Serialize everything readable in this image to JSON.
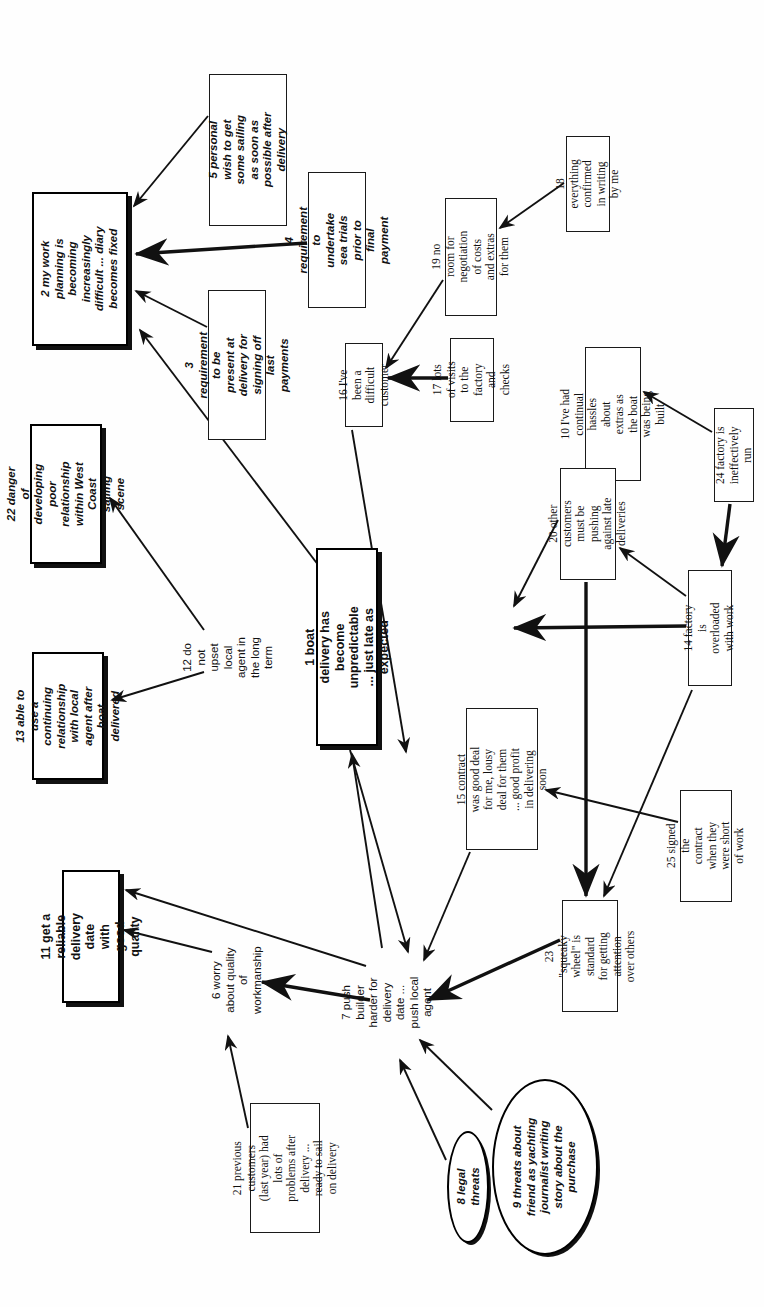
{
  "diagram": {
    "orientation": "text rotated 90 degrees (reads bottom-to-top)",
    "background_color": "#ffffff",
    "line_color": "#111111",
    "nodes": [
      {
        "id": "n1",
        "number": "1",
        "label": "1 boat delivery has become unpredictable ... just late as expected",
        "shape": "box-shadow",
        "style": "bold",
        "x": 316,
        "y": 548,
        "w": 62,
        "h": 198
      },
      {
        "id": "n2",
        "number": "2",
        "label": "2 my work planning is becoming increasingly difficult ... diary becomes fixed",
        "shape": "box-shadow",
        "style": "bold-italic",
        "x": 32,
        "y": 192,
        "w": 96,
        "h": 154
      },
      {
        "id": "n3",
        "number": "3",
        "label": "3 requirement to be present at delivery for signing off last payments",
        "shape": "box",
        "style": "italic",
        "x": 208,
        "y": 290,
        "w": 58,
        "h": 150
      },
      {
        "id": "n4",
        "number": "4",
        "label": "4 requirement to undertake sea trials prior to final payment",
        "shape": "box",
        "style": "italic",
        "x": 308,
        "y": 172,
        "w": 58,
        "h": 136
      },
      {
        "id": "n5",
        "number": "5",
        "label": "5 personal wish to get some sailing as soon as possible after delivery",
        "shape": "box",
        "style": "italic",
        "x": 209,
        "y": 74,
        "w": 78,
        "h": 152
      },
      {
        "id": "n6",
        "number": "6",
        "label": "6 worry about quality of workmanship",
        "shape": "plain",
        "style": "plain-sans",
        "x": 215,
        "y": 930,
        "w": 44,
        "h": 100
      },
      {
        "id": "n7",
        "number": "7",
        "label": "7 push builder harder for delivery date ... push local agent",
        "shape": "plain",
        "style": "plain-sans",
        "x": 358,
        "y": 952,
        "w": 58,
        "h": 100
      },
      {
        "id": "n8",
        "number": "8",
        "label": "8 legal threats",
        "shape": "ellipse",
        "style": "bold-italic",
        "x": 447,
        "y": 1131,
        "w": 42,
        "h": 112
      },
      {
        "id": "n9",
        "number": "9",
        "label": "9 threats about friend as yachting journalist writing story about the purchase",
        "shape": "ellipse",
        "style": "bold-italic",
        "x": 492,
        "y": 1079,
        "w": 106,
        "h": 176
      },
      {
        "id": "n10",
        "number": "10",
        "label": "10 I've had continual hassles about extras as the boat was being built",
        "shape": "box",
        "style": "serif",
        "x": 585,
        "y": 347,
        "w": 56,
        "h": 134
      },
      {
        "id": "n11",
        "number": "11",
        "label": "11 get a reliable delivery date with good quality",
        "shape": "box-shadow",
        "style": "bold",
        "x": 62,
        "y": 870,
        "w": 58,
        "h": 133
      },
      {
        "id": "n12",
        "number": "12",
        "label": "12 do not upset local agent in the long term",
        "shape": "plain",
        "style": "plain-sans",
        "x": 206,
        "y": 608,
        "w": 44,
        "h": 98
      },
      {
        "id": "n13",
        "number": "13",
        "label": "13 able to use a continuing relationship with local agent after boat delivered",
        "shape": "box-shadow",
        "style": "bold-italic",
        "x": 32,
        "y": 652,
        "w": 72,
        "h": 128
      },
      {
        "id": "n14",
        "number": "14",
        "label": "14 factory is overloaded with work",
        "shape": "box",
        "style": "serif",
        "x": 688,
        "y": 570,
        "w": 44,
        "h": 116
      },
      {
        "id": "n15",
        "number": "15",
        "label": "15 contract was good deal for me, lousy deal for them ... good profit in delivering soon",
        "shape": "box",
        "style": "serif",
        "x": 466,
        "y": 708,
        "w": 72,
        "h": 142
      },
      {
        "id": "n16",
        "number": "16",
        "label": "16 I've been a difficult customer",
        "shape": "box",
        "style": "serif",
        "x": 345,
        "y": 343,
        "w": 38,
        "h": 84
      },
      {
        "id": "n17",
        "number": "17",
        "label": "17 lots of visits to the factory and checks",
        "shape": "box",
        "style": "serif",
        "x": 450,
        "y": 338,
        "w": 44,
        "h": 84
      },
      {
        "id": "n18",
        "number": "18",
        "label": "18 everything confirmed in writing by me",
        "shape": "box",
        "style": "serif",
        "x": 566,
        "y": 136,
        "w": 44,
        "h": 96
      },
      {
        "id": "n19",
        "number": "19",
        "label": "19 no room for negotiation of costs and extras for them",
        "shape": "box",
        "style": "serif",
        "x": 445,
        "y": 198,
        "w": 52,
        "h": 118
      },
      {
        "id": "n20",
        "number": "20",
        "label": "20 other customers must be pushing against late deliveries",
        "shape": "box",
        "style": "serif",
        "x": 560,
        "y": 468,
        "w": 56,
        "h": 112
      },
      {
        "id": "n21",
        "number": "21",
        "label": "21 previous customers (last year) had lots of problems after delivery ... ready to sail on delivery",
        "shape": "box",
        "style": "serif",
        "x": 250,
        "y": 1103,
        "w": 70,
        "h": 130
      },
      {
        "id": "n22",
        "number": "22",
        "label": "22 danger of developing poor relationship within West Coast sailing scene",
        "shape": "box-shadow",
        "style": "bold-italic",
        "x": 30,
        "y": 424,
        "w": 72,
        "h": 140
      },
      {
        "id": "n23",
        "number": "23",
        "label": "23 \"squeaky wheel\" is standard for getting attention over others",
        "shape": "box",
        "style": "serif",
        "x": 562,
        "y": 900,
        "w": 56,
        "h": 112
      },
      {
        "id": "n24",
        "number": "24",
        "label": "24 factory is ineffectively run",
        "shape": "box",
        "style": "serif",
        "x": 714,
        "y": 408,
        "w": 40,
        "h": 94
      },
      {
        "id": "n25",
        "number": "25",
        "label": "25 signed the contract when they were short of work",
        "shape": "box",
        "style": "serif",
        "x": 680,
        "y": 790,
        "w": 52,
        "h": 112
      }
    ],
    "links": [
      {
        "from": "n5",
        "to": "n2",
        "path": "M 208 116 L 134 206"
      },
      {
        "from": "n4",
        "to": "n2",
        "path": "M 307 243 L 136 254",
        "thick": true
      },
      {
        "from": "n3",
        "to": "n2",
        "path": "M 207 327 L 136 291"
      },
      {
        "from": "n12",
        "to": "n22",
        "path": "M 204 630 L 110 498"
      },
      {
        "from": "n12",
        "to": "n13",
        "path": "M 204 672 L 112 700"
      },
      {
        "from": "n1",
        "to": "n2",
        "path": "M 322 570 L 140 330"
      },
      {
        "from": "n18",
        "to": "n19",
        "path": "M 564 183 L 500 228"
      },
      {
        "from": "n19",
        "to": "n16",
        "path": "M 443 280 L 386 368"
      },
      {
        "from": "n17",
        "to": "n16",
        "path": "M 448 378 L 388 378",
        "thick": true
      },
      {
        "from": "n24",
        "to": "n10",
        "path": "M 712 432 L 644 392"
      },
      {
        "from": "n24",
        "to": "n14",
        "path": "M 730 504 L 722 566",
        "thick": true
      },
      {
        "from": "n14",
        "to": "n20",
        "path": "M 686 596 L 620 548"
      },
      {
        "from": "n14",
        "to": "n1",
        "path": "M 686 626 L 514 628",
        "thick": true
      },
      {
        "from": "n20",
        "to": "n1",
        "path": "M 558 520 L 514 606"
      },
      {
        "from": "n16",
        "to": "n1",
        "path": "M 352 430 L 406 752",
        "reverse": true
      },
      {
        "from": "n20",
        "to": "n23",
        "path": "M 586 582 L 586 896",
        "thick": true
      },
      {
        "from": "n14",
        "to": "n23",
        "path": "M 692 690 L 604 896"
      },
      {
        "from": "n25",
        "to": "n15",
        "path": "M 678 822 L 546 790"
      },
      {
        "from": "n15",
        "to": "n7",
        "path": "M 470 852 L 424 960"
      },
      {
        "from": "n1",
        "to": "n7",
        "path": "M 350 750 L 408 952",
        "reverse": true
      },
      {
        "from": "n7",
        "to": "n1",
        "path": "M 382 948 L 352 754"
      },
      {
        "from": "n23",
        "to": "n7",
        "path": "M 560 940 L 428 1000",
        "thick": true
      },
      {
        "from": "n8",
        "to": "n7",
        "path": "M 446 1160 L 400 1060"
      },
      {
        "from": "n9",
        "to": "n7",
        "path": "M 492 1110 L 420 1040"
      },
      {
        "from": "n7",
        "to": "n6",
        "path": "M 370 1000 L 262 982",
        "thick": true
      },
      {
        "from": "n21",
        "to": "n6",
        "path": "M 248 1128 L 228 1036"
      },
      {
        "from": "n6",
        "to": "n11",
        "path": "M 212 952 L 124 930"
      },
      {
        "from": "n7",
        "to": "n11",
        "path": "M 366 966 L 126 890"
      }
    ]
  }
}
